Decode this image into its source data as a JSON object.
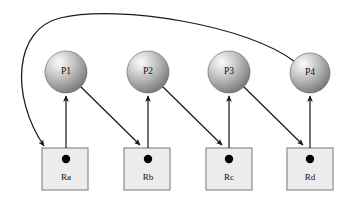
{
  "diagram": {
    "type": "resource-allocation-graph",
    "canvas": {
      "width": 341,
      "height": 198,
      "background": "#ffffff"
    },
    "colors": {
      "background": "#ffffff",
      "sphere_light": "#f2f2f2",
      "sphere_mid": "#b4b4b4",
      "sphere_dark": "#787878",
      "sphere_edge": "#6e6e6e",
      "box_fill": "#ececec",
      "box_border": "#8c8c8c",
      "token_dot": "#000000",
      "edge_stroke": "#1a1a1a",
      "text": "#111111"
    },
    "processes": [
      {
        "id": "P1",
        "label": "P1",
        "cx": 66,
        "cy": 72,
        "r": 21
      },
      {
        "id": "P2",
        "label": "P2",
        "cx": 148,
        "cy": 72,
        "r": 21
      },
      {
        "id": "P3",
        "label": "P3",
        "cx": 229,
        "cy": 72,
        "r": 21
      },
      {
        "id": "P4",
        "label": "P4",
        "cx": 310,
        "cy": 73,
        "r": 20
      }
    ],
    "resources": [
      {
        "id": "Ra",
        "label": "Ra",
        "x": 42,
        "y": 148,
        "w": 46,
        "h": 42,
        "dot_cx": 66,
        "dot_cy": 159,
        "dot_r": 4
      },
      {
        "id": "Rb",
        "label": "Rb",
        "x": 124,
        "y": 148,
        "w": 46,
        "h": 42,
        "dot_cx": 148,
        "dot_cy": 159,
        "dot_r": 4
      },
      {
        "id": "Rc",
        "label": "Rc",
        "x": 206,
        "y": 148,
        "w": 46,
        "h": 42,
        "dot_cx": 229,
        "dot_cy": 159,
        "dot_r": 4
      },
      {
        "id": "Rd",
        "label": "Rd",
        "x": 287,
        "y": 148,
        "w": 46,
        "h": 42,
        "dot_cx": 310,
        "dot_cy": 159,
        "dot_r": 4
      }
    ],
    "allocation_edges": [
      {
        "id": "Ra-to-P1",
        "from": "Ra",
        "to": "P1",
        "kind": "allocation",
        "path": "M 66 148 L 66 95"
      },
      {
        "id": "Rb-to-P2",
        "from": "Rb",
        "to": "P2",
        "kind": "allocation",
        "path": "M 148 148 L 148 95"
      },
      {
        "id": "Rc-to-P3",
        "from": "Rc",
        "to": "P3",
        "kind": "allocation",
        "path": "M 229 148 L 229 95"
      },
      {
        "id": "Rd-to-P4",
        "from": "Rd",
        "to": "P4",
        "kind": "allocation",
        "path": "M 310 148 L 310 95"
      }
    ],
    "request_edges": [
      {
        "id": "P1-to-Rb",
        "from": "P1",
        "to": "Rb",
        "kind": "request",
        "path": "M 81 86 L 141 146"
      },
      {
        "id": "P2-to-Rc",
        "from": "P2",
        "to": "Rc",
        "kind": "request",
        "path": "M 163 86 L 223 146"
      },
      {
        "id": "P3-to-Rd",
        "from": "P3",
        "to": "Rd",
        "kind": "request",
        "path": "M 244 86 L 304 146"
      },
      {
        "id": "P4-to-Ra",
        "from": "P4",
        "to": "Ra",
        "kind": "request-wraparound",
        "path": "M 295 62 C 250 26 120 4 60 18 C 14 29 10 96 44 146"
      }
    ]
  }
}
